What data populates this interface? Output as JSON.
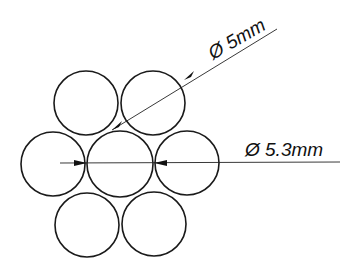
{
  "diagram": {
    "stroke_color": "#1a1a1a",
    "background": "#ffffff",
    "strands": [
      {
        "name": "top-left",
        "cx": 86,
        "cy": 103,
        "r": 32
      },
      {
        "name": "top-right",
        "cx": 153,
        "cy": 103,
        "r": 32
      },
      {
        "name": "middle-left",
        "cx": 53,
        "cy": 164,
        "r": 32
      },
      {
        "name": "center",
        "cx": 120,
        "cy": 164,
        "r": 33
      },
      {
        "name": "middle-right",
        "cx": 187,
        "cy": 163,
        "r": 32
      },
      {
        "name": "bottom-left",
        "cx": 87,
        "cy": 225,
        "r": 32
      },
      {
        "name": "bottom-right",
        "cx": 154,
        "cy": 224,
        "r": 32
      }
    ],
    "annotations": {
      "strand_diameter": {
        "label": "Ø 5mm"
      },
      "center_diameter": {
        "label": "Ø 5.3mm"
      }
    }
  }
}
